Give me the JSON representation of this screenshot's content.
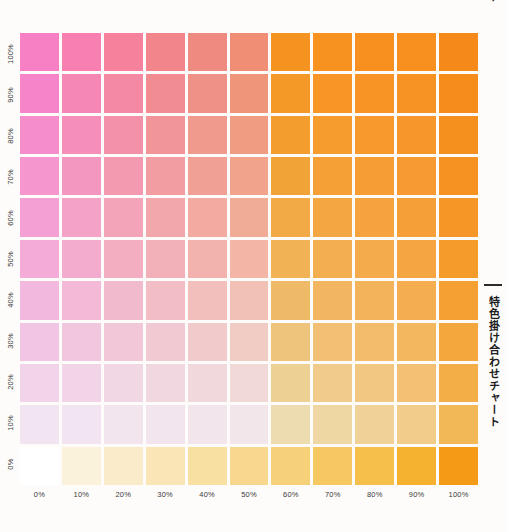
{
  "title_vertical": "特色掛け合わせチャート",
  "top_cut_text": "ト",
  "background_color": "#fdfcfa",
  "gridline_color": "#ffffff",
  "label_color": "#3b3b3b",
  "rule_color": "#2b2b2b",
  "y_axis": {
    "name": "magenta-spot-percentage",
    "ticks": [
      "100%",
      "90%",
      "80%",
      "70%",
      "60%",
      "50%",
      "40%",
      "30%",
      "20%",
      "10%",
      "0%"
    ]
  },
  "x_axis": {
    "name": "orange-spot-percentage",
    "ticks": [
      "0%",
      "10%",
      "20%",
      "30%",
      "40%",
      "50%",
      "60%",
      "70%",
      "80%",
      "90%",
      "100%"
    ]
  },
  "chart_data": {
    "type": "heatmap",
    "title": "特色掛け合わせチャート",
    "xlabel": "",
    "ylabel": "",
    "grid": false,
    "legend": "none",
    "x": [
      0,
      10,
      20,
      30,
      40,
      50,
      60,
      70,
      80,
      90,
      100
    ],
    "y": [
      100,
      90,
      80,
      70,
      60,
      50,
      40,
      30,
      20,
      10,
      0
    ],
    "x_tick_labels": [
      "0%",
      "10%",
      "20%",
      "30%",
      "40%",
      "50%",
      "60%",
      "70%",
      "80%",
      "90%",
      "100%"
    ],
    "y_tick_labels": [
      "100%",
      "90%",
      "80%",
      "70%",
      "60%",
      "50%",
      "40%",
      "30%",
      "20%",
      "10%",
      "0%"
    ],
    "xlim": [
      0,
      100
    ],
    "ylim": [
      0,
      100
    ],
    "ink_colors": {
      "spot_a_name": "magenta-pink",
      "spot_a_hex": "#f472b6",
      "spot_b_name": "orange",
      "spot_b_hex": "#f7901e"
    },
    "rows": [
      {
        "y": 100,
        "colors": [
          "#f77fc4",
          "#f780b0",
          "#f5819c",
          "#f2858c",
          "#ef8a80",
          "#ef8e74",
          "#f4931f",
          "#f79221",
          "#f89020",
          "#f89020",
          "#f5891a"
        ]
      },
      {
        "y": 90,
        "colors": [
          "#f585c8",
          "#f587b5",
          "#f389a2",
          "#f18d92",
          "#ef9186",
          "#ef957a",
          "#f49827",
          "#f79627",
          "#f89426",
          "#f79225",
          "#f58c1c"
        ]
      },
      {
        "y": 80,
        "colors": [
          "#f68dcb",
          "#f58fba",
          "#f391a8",
          "#f19599",
          "#f0998d",
          "#f09c82",
          "#f39d2e",
          "#f69b2d",
          "#f7992c",
          "#f7962a",
          "#f58f1e"
        ]
      },
      {
        "y": 70,
        "colors": [
          "#f596cf",
          "#f497c0",
          "#f39ab0",
          "#f29da2",
          "#f1a096",
          "#f1a38c",
          "#f2a338",
          "#f5a036",
          "#f69e34",
          "#f69a31",
          "#f59222"
        ]
      },
      {
        "y": 60,
        "colors": [
          "#f5a0d4",
          "#f4a2c6",
          "#f3a4b8",
          "#f2a7ac",
          "#f2aaa1",
          "#f1ac98",
          "#f1aa45",
          "#f4a642",
          "#f5a33e",
          "#f59f39",
          "#f59626"
        ]
      },
      {
        "y": 50,
        "colors": [
          "#f4abd8",
          "#f3acce",
          "#f3aec2",
          "#f2b1b8",
          "#f2b3ae",
          "#f2b5a6",
          "#f0b255",
          "#f3ae50",
          "#f4ab4b",
          "#f5a643",
          "#f59b2c"
        ]
      },
      {
        "y": 40,
        "colors": [
          "#f3b8de",
          "#f3b9d6",
          "#f2bbcd",
          "#f2bdc5",
          "#f2bfbd",
          "#f2c1b5",
          "#efba68",
          "#f2b662",
          "#f3b35a",
          "#f4ae50",
          "#f4a033"
        ]
      },
      {
        "y": 30,
        "colors": [
          "#f2c5e4",
          "#f2c6de",
          "#f2c8d8",
          "#f1c9d2",
          "#f1cbcb",
          "#f1ccc5",
          "#eec47c",
          "#f1c074",
          "#f2bc6b",
          "#f3b75f",
          "#f4a73c"
        ]
      },
      {
        "y": 20,
        "colors": [
          "#f1d4ea",
          "#f1d5e7",
          "#f1d6e3",
          "#f1d7e0",
          "#f1d8dc",
          "#f1d9d8",
          "#edd094",
          "#f0cb8b",
          "#f1c781",
          "#f2c173",
          "#f3ae48"
        ]
      },
      {
        "y": 10,
        "colors": [
          "#f2e4f1",
          "#f2e4f0",
          "#f2e5ee",
          "#f2e5ed",
          "#f2e6ec",
          "#f2e6ea",
          "#ecdcaf",
          "#efd7a4",
          "#f0d299",
          "#f1cc8a",
          "#f2b857"
        ]
      },
      {
        "y": 0,
        "colors": [
          "#ffffff",
          "#fbf2dc",
          "#faecca",
          "#f9e5b5",
          "#f8dfa2",
          "#f8d88e",
          "#f7d179",
          "#f6c862",
          "#f6bf4c",
          "#f5b231",
          "#f49a16"
        ]
      }
    ]
  }
}
